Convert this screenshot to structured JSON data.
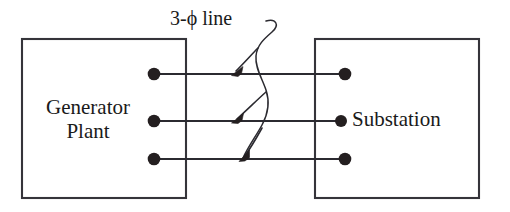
{
  "diagram": {
    "background_color": "#ffffff",
    "line_color": "#2b2a30",
    "dot_color": "#241f20",
    "blocks": [
      {
        "id": "generator-plant",
        "label": "Generator\nPlant",
        "x": 22,
        "y": 39,
        "width": 164,
        "height": 159
      },
      {
        "id": "substation",
        "label": "Substation",
        "x": 315,
        "y": 39,
        "width": 164,
        "height": 159
      }
    ],
    "annotation": {
      "id": "three-phase-line",
      "text": "3-ϕ line",
      "pointer_count": 3
    },
    "terminals": {
      "left": [
        {
          "id": "gen-terminal-a",
          "cx": 154,
          "cy": 74
        },
        {
          "id": "gen-terminal-b",
          "cx": 154,
          "cy": 121
        },
        {
          "id": "gen-terminal-c",
          "cx": 154,
          "cy": 159
        }
      ],
      "right": [
        {
          "id": "sub-terminal-a",
          "cx": 345,
          "cy": 74
        },
        {
          "id": "sub-terminal-b",
          "cx": 341,
          "cy": 121
        },
        {
          "id": "sub-terminal-c",
          "cx": 345,
          "cy": 159
        }
      ]
    },
    "conductors": [
      {
        "id": "phase-a-conductor",
        "x1": 154,
        "y1": 74,
        "x2": 345,
        "y2": 74
      },
      {
        "id": "phase-b-conductor",
        "x1": 154,
        "y1": 121,
        "x2": 341,
        "y2": 121
      },
      {
        "id": "phase-c-conductor",
        "x1": 154,
        "y1": 159,
        "x2": 345,
        "y2": 159
      }
    ]
  }
}
